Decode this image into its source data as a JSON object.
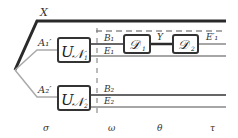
{
  "diagram": {
    "type": "quantum-circuit",
    "colors": {
      "thick_wire": "#2a2a2a",
      "thin_wire": "#555555",
      "gray_wire": "#aaaaaa",
      "box_border": "#333333",
      "box_fill": "#ffffff",
      "dashed": "#555555"
    },
    "wires": {
      "x": "X",
      "a1": "A₁′",
      "a2": "A₂′",
      "b1": "B₁",
      "e1": "E₁",
      "b2": "B₂",
      "e2": "E₂",
      "y": "Y",
      "e1prime": "E′₁"
    },
    "boxes": {
      "un1": {
        "main": "U",
        "sub": "𝒩",
        "index": "1"
      },
      "un2": {
        "main": "U",
        "sub": "𝒩",
        "index": "2"
      },
      "d1": {
        "main": "𝒟",
        "index": "1"
      },
      "d2": {
        "main": "𝒟",
        "index": "2"
      }
    },
    "stages": {
      "sigma": "σ",
      "omega": "ω",
      "theta": "θ",
      "tau": "τ"
    }
  }
}
